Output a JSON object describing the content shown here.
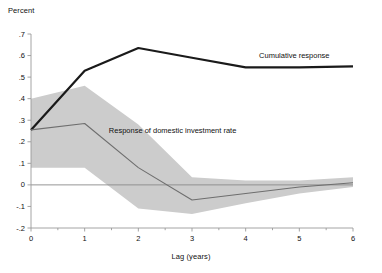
{
  "chart_data": {
    "type": "line",
    "title": "",
    "xlabel": "Lag (years)",
    "ylabel": "Percent",
    "xlim": [
      0,
      6
    ],
    "ylim": [
      -0.2,
      0.7
    ],
    "grid": false,
    "legend_position": "inline-annotations",
    "x": [
      0,
      1,
      2,
      3,
      4,
      5,
      6
    ],
    "xticks": [
      "0",
      "1",
      "2",
      "3",
      "4",
      "5",
      "6"
    ],
    "yticks": [
      ".7",
      ".6",
      ".5",
      ".4",
      ".3",
      ".2",
      ".1",
      "0",
      "-.1",
      "-.2"
    ],
    "ytick_values": [
      0.7,
      0.6,
      0.5,
      0.4,
      0.3,
      0.2,
      0.1,
      0,
      -0.1,
      -0.2
    ],
    "zero_line": 0,
    "series": [
      {
        "name": "Cumulative response",
        "color": "#1a1a1a",
        "width": 2.2,
        "values": [
          0.255,
          0.53,
          0.635,
          0.59,
          0.545,
          0.545,
          0.55
        ],
        "label_x": 4.25,
        "label_y": 0.6
      },
      {
        "name": "Response of domestic investment rate",
        "color": "#6e6e6e",
        "width": 1.1,
        "values": [
          0.255,
          0.285,
          0.08,
          -0.07,
          -0.04,
          -0.01,
          0.01
        ],
        "label_x": 1.45,
        "label_y": 0.25
      }
    ],
    "confidence_band": {
      "name": "confidence interval",
      "color": "#cccccc",
      "upper": [
        0.4,
        0.46,
        0.28,
        0.035,
        0.02,
        0.02,
        0.035
      ],
      "lower": [
        0.08,
        0.08,
        -0.11,
        -0.135,
        -0.085,
        -0.04,
        -0.01
      ]
    }
  }
}
